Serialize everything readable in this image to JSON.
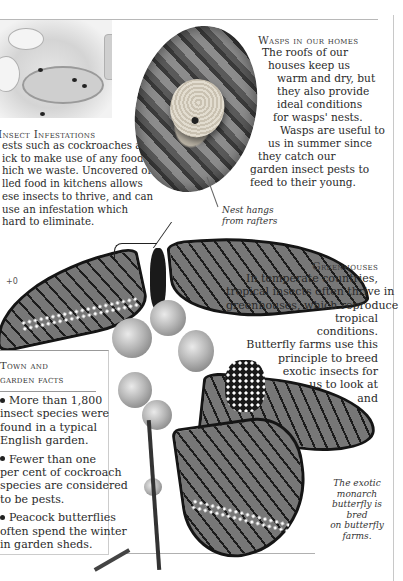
{
  "page": {
    "photos": {
      "table_scene": {
        "icon": "kitchen-table-photo"
      },
      "wasp_nest": {
        "icon": "wasp-nest-photo"
      },
      "monarch_butterflies": {
        "icon": "monarch-butterfly-photo"
      }
    },
    "insect_infestations": {
      "heading": "Insect Infestations",
      "lines": [
        "ests such as cockroaches are",
        "ick to make use of any food",
        "hich we waste. Uncovered or",
        "lled food in kitchens allows",
        "ese insects to thrive, and can",
        "use an infestation which",
        "hard to eliminate."
      ]
    },
    "wasps": {
      "heading": "Wasps in our homes",
      "lines": [
        "The roofs of our",
        "houses keep us",
        "warm and dry, but",
        "they also provide",
        "ideal conditions",
        "for wasps' nests.",
        "Wasps are useful to",
        "us in summer since",
        "they catch our",
        "garden insect pests to",
        "feed to their young."
      ],
      "caption": [
        "Nest hangs",
        "from rafters"
      ]
    },
    "page_ref": "+0",
    "greenhouses": {
      "heading": "Greenhouses",
      "lines": [
        "In temperate countries,",
        "tropical insects often thrive in",
        "greenhouses, which reproduce",
        "tropical",
        "conditions.",
        "Butterfly farms use this",
        "principle to breed",
        "exotic insects for",
        "us to  look at",
        "and"
      ]
    },
    "facts": {
      "title_line1": "Town and",
      "title_line2": "garden facts",
      "items": [
        {
          "lines": [
            "More than 1,800",
            "insect species were",
            "found in a typical",
            "English garden."
          ]
        },
        {
          "lines": [
            "Fewer than one",
            "per cent of cockroach",
            "species are considered",
            "to be pests."
          ]
        },
        {
          "lines": [
            "Peacock butterflies",
            "often spend the winter",
            "in garden sheds."
          ]
        }
      ]
    },
    "monarch_caption": [
      "The exotic",
      "monarch",
      "butterfly is bred",
      "on butterfly",
      "farms."
    ]
  }
}
